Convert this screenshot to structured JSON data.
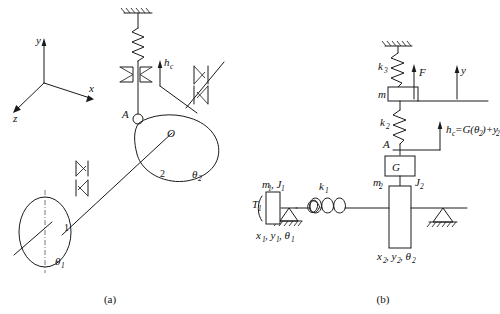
{
  "figure": {
    "background_color": "#ffffff",
    "line_color": "#1a1a1a",
    "text_color": "#111111"
  },
  "panel_a": {
    "caption": "(a)",
    "axes": {
      "name": "coordinate-triad",
      "x_label": "x",
      "y_label": "y",
      "z_label": "z"
    },
    "labels": {
      "point_a": "A",
      "point_o": "O",
      "disk1_number": "1",
      "disk2_number": "2",
      "theta1": "θ",
      "theta1_sub": "1",
      "theta2": "θ",
      "theta2_sub": "2",
      "hc": "h",
      "hc_sub": "c"
    },
    "elements": {
      "ground_hatch": "fixed-support-hatching",
      "spring": "coil-spring",
      "damper": "damper-element",
      "bearing_upper": "bearing-symbol",
      "bearing_lower": "bearing-symbol",
      "cam": "cam-profile-body",
      "rotor_disk": "rotor-disk-ellipse",
      "shaft": "drive-shaft-line",
      "follower_pin": "follower-pin-circle"
    }
  },
  "panel_b": {
    "caption": "(b)",
    "labels": {
      "k3": "k",
      "k3_sub": "3",
      "k2": "k",
      "k2_sub": "2",
      "k1": "k",
      "k1_sub": "1",
      "force_f": "F",
      "mass_m": "m",
      "axis_y": "y",
      "point_a": "A",
      "gear_g": "G",
      "hc_expr_h": "h",
      "hc_expr_h_sub": "c",
      "hc_expr_rest": "=G(θ",
      "hc_expr_rest_sub": "2",
      "hc_expr_tail": ")+y",
      "hc_expr_tail_sub": "2",
      "torque_t1": "T",
      "torque_t1_sub": "1",
      "m1j1": "m",
      "m1j1_sub1": "1",
      "m1j1_mid": ", J",
      "m1j1_sub2": "1",
      "coords1": "x",
      "coords1_sub1": "1",
      "coords1_mid": ", y",
      "coords1_sub2": "1",
      "coords1_mid2": ", θ",
      "coords1_sub3": "1",
      "m2": "m",
      "m2_sub": "2",
      "j2": "J",
      "j2_sub": "2",
      "coords2": "x",
      "coords2_sub1": "2",
      "coords2_mid": ", y",
      "coords2_sub2": "2",
      "coords2_mid2": ", θ",
      "coords2_sub3": "2"
    },
    "elements": {
      "ceiling_hatch": "fixed-ceiling-hatching",
      "spring_k3": "coil-spring-k3",
      "spring_k2": "coil-spring-k2",
      "spring_k1": "coil-spring-k1",
      "mass_block_m": "mass-block-m",
      "gear_block_g": "gear-block-G",
      "rotor_block_1": "rotor-block-1",
      "rotor_block_2": "rotor-block-2",
      "support_left": "triangle-ground-support",
      "support_right": "triangle-ground-support",
      "force_arrow": "force-arrow-F",
      "axis_arrow_y": "axis-arrow-y",
      "hc_arrow": "displacement-arrow-hc",
      "torque_arc": "torque-arc-T1"
    }
  }
}
